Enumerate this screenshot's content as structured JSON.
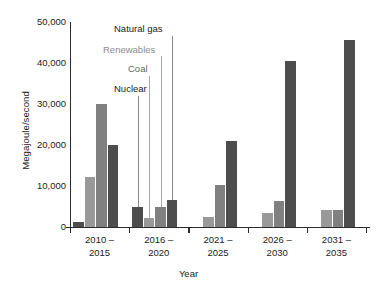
{
  "chart_data": {
    "type": "bar",
    "title": "",
    "xlabel": "Year",
    "ylabel": "Megajoule/second",
    "ylim": [
      0,
      50000
    ],
    "ytick_values": [
      0,
      10000,
      20000,
      30000,
      40000,
      50000
    ],
    "ytick_labels": [
      "0",
      "10,000",
      "20,000",
      "30,000",
      "40,000",
      "50,000"
    ],
    "grid": false,
    "legend_position": "in-plot-callouts",
    "categories": [
      "2010 – 2015",
      "2016 – 2020",
      "2021 – 2025",
      "2026 – 2030",
      "2031 – 2035"
    ],
    "category_lines": [
      [
        "2010 –",
        "2015"
      ],
      [
        "2016 –",
        "2020"
      ],
      [
        "2021 –",
        "2025"
      ],
      [
        "2026 –",
        "2030"
      ],
      [
        "2031 –",
        "2035"
      ]
    ],
    "series": [
      {
        "name": "Nuclear",
        "color": "#4d4d4d",
        "values": [
          1200,
          5000,
          0,
          0,
          0
        ]
      },
      {
        "name": "Coal",
        "color": "#999999",
        "values": [
          12300,
          2100,
          2500,
          3300,
          4100
        ]
      },
      {
        "name": "Renewables",
        "color": "#808080",
        "values": [
          30000,
          4800,
          10300,
          6400,
          4100
        ]
      },
      {
        "name": "Natural gas",
        "color": "#4d4d4d",
        "values": [
          20000,
          6500,
          21000,
          40500,
          45700
        ]
      }
    ],
    "annotations": [
      {
        "label": "Natural gas",
        "color": "#1a1a1a"
      },
      {
        "label": "Renewables",
        "color": "#8c8c8c"
      },
      {
        "label": "Coal",
        "color": "#666666"
      },
      {
        "label": "Nuclear",
        "color": "#1a1a1a"
      }
    ]
  },
  "axes": {
    "y_title": "Megajoule/second",
    "x_title": "Year"
  }
}
